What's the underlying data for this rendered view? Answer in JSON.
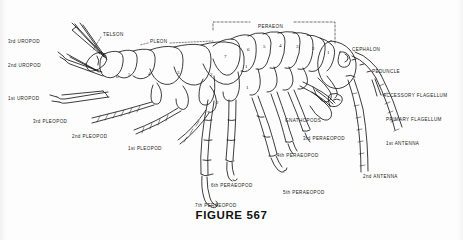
{
  "figure": {
    "caption": "FIGURE 567",
    "background_color": "#fdfdfd",
    "ink_color": "#1a1a1a"
  },
  "region_labels": [
    {
      "id": "telson",
      "text": "TELSON",
      "x": 103,
      "y": 33,
      "align": "left"
    },
    {
      "id": "pleon",
      "text": "PLEON",
      "x": 150,
      "y": 40,
      "align": "left"
    },
    {
      "id": "peraeon",
      "text": "PERAEON",
      "x": 258,
      "y": 25,
      "align": "left"
    }
  ],
  "left_labels": [
    {
      "id": "uropod-3",
      "text": "3rd UROPOD",
      "x": 8,
      "y": 40
    },
    {
      "id": "uropod-2",
      "text": "2nd UROPOD",
      "x": 8,
      "y": 64
    },
    {
      "id": "uropod-1",
      "text": "1st UROPOD",
      "x": 8,
      "y": 97
    },
    {
      "id": "pleopod-3",
      "text": "3rd PLEOPOD",
      "x": 33,
      "y": 120
    },
    {
      "id": "pleopod-2",
      "text": "2nd PLEOPOD",
      "x": 72,
      "y": 135
    },
    {
      "id": "pleopod-1",
      "text": "1st PLEOPOD",
      "x": 128,
      "y": 147
    }
  ],
  "right_labels": [
    {
      "id": "cephalon",
      "text": "CEPHALON",
      "x": 352,
      "y": 48
    },
    {
      "id": "peduncle",
      "text": "PEDUNCLE",
      "x": 372,
      "y": 70
    },
    {
      "id": "accessory-flagellum",
      "text": "ACCESSORY FLAGELLUM",
      "x": 383,
      "y": 94
    },
    {
      "id": "primary-flagellum",
      "text": "PRIMARY FLAGELLUM",
      "x": 386,
      "y": 118
    },
    {
      "id": "antenna-1",
      "text": "1st ANTENNA",
      "x": 386,
      "y": 142
    },
    {
      "id": "antenna-2",
      "text": "2nd ANTENNA",
      "x": 363,
      "y": 175
    }
  ],
  "appendage_labels": [
    {
      "id": "gnathopods",
      "text": "GNATHOPODS",
      "x": 285,
      "y": 119
    },
    {
      "id": "peraeopod-3",
      "text": "3rd PERAEOPOD",
      "x": 303,
      "y": 137
    },
    {
      "id": "peraeopod-4",
      "text": "4th PERAEOPOD",
      "x": 277,
      "y": 154
    },
    {
      "id": "peraeopod-6",
      "text": "6th PERAEOPOD",
      "x": 211,
      "y": 184
    },
    {
      "id": "peraeopod-5",
      "text": "5th PERAEOPOD",
      "x": 283,
      "y": 191
    },
    {
      "id": "peraeopod-7",
      "text": "7th PERAEOPOD",
      "x": 195,
      "y": 204
    }
  ],
  "pleon_segment_numbers": [
    {
      "n": "6",
      "x": 116,
      "y": 74
    },
    {
      "n": "5",
      "x": 128,
      "y": 72
    },
    {
      "n": "4",
      "x": 148,
      "y": 71
    },
    {
      "n": "3",
      "x": 177,
      "y": 70
    },
    {
      "n": "2",
      "x": 210,
      "y": 72
    },
    {
      "n": "1",
      "x": 245,
      "y": 64
    }
  ],
  "peraeon_segment_numbers": [
    {
      "n": "7",
      "x": 224,
      "y": 54
    },
    {
      "n": "6",
      "x": 247,
      "y": 47
    },
    {
      "n": "5",
      "x": 263,
      "y": 44
    },
    {
      "n": "4",
      "x": 279,
      "y": 43
    },
    {
      "n": "3",
      "x": 296,
      "y": 44
    },
    {
      "n": "2",
      "x": 312,
      "y": 46
    },
    {
      "n": "1",
      "x": 327,
      "y": 50
    }
  ],
  "coxa_numbers": [
    {
      "n": "1",
      "x": 246,
      "y": 85
    },
    {
      "n": "2",
      "x": 216,
      "y": 100
    }
  ]
}
